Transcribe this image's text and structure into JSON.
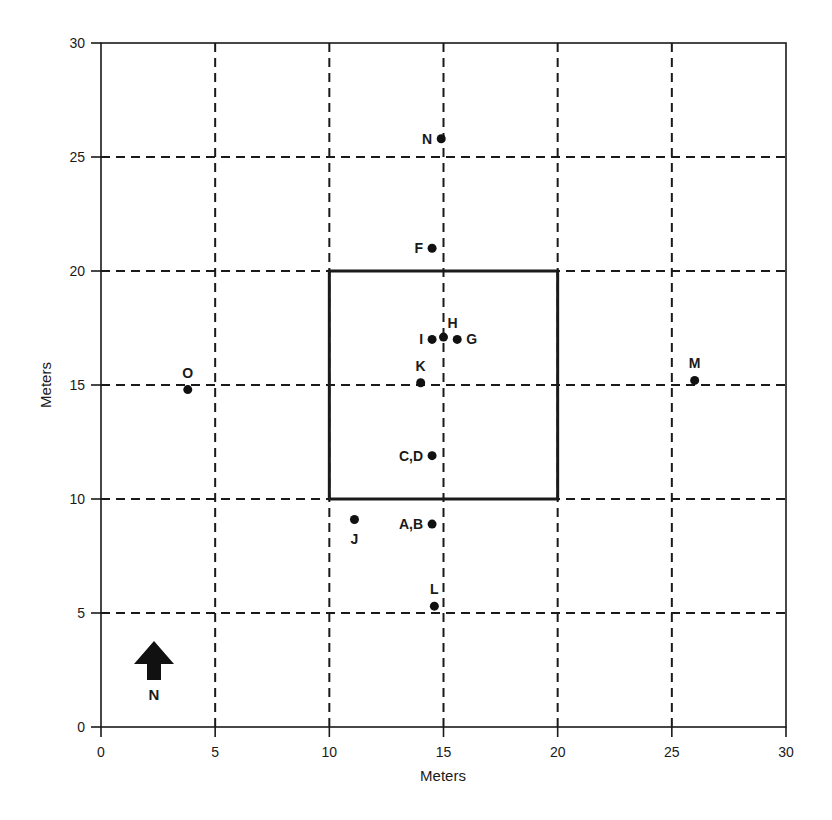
{
  "chart_data": {
    "type": "scatter",
    "title": "",
    "xlabel": "Meters",
    "ylabel": "Meters",
    "xlim": [
      0,
      30
    ],
    "ylim": [
      0,
      30
    ],
    "xticks": [
      0,
      5,
      10,
      15,
      20,
      25,
      30
    ],
    "yticks": [
      0,
      5,
      10,
      15,
      20,
      25,
      30
    ],
    "grid": {
      "on": true,
      "style": "dashed",
      "x": [
        5,
        10,
        15,
        20,
        25
      ],
      "y": [
        5,
        10,
        15,
        20,
        25
      ]
    },
    "legend": null,
    "annotations": [
      {
        "type": "rectangle",
        "x": [
          10,
          20
        ],
        "y": [
          10,
          20
        ],
        "style": "solid-thick"
      },
      {
        "type": "north-arrow",
        "label": "N",
        "x": 2.3,
        "y": 2.5
      }
    ],
    "points": [
      {
        "label": "N",
        "x": 14.9,
        "y": 25.8,
        "label_pos": "left"
      },
      {
        "label": "F",
        "x": 14.5,
        "y": 21.0,
        "label_pos": "left"
      },
      {
        "label": "H",
        "x": 15.0,
        "y": 17.1,
        "label_pos": "above-right"
      },
      {
        "label": "I",
        "x": 14.5,
        "y": 17.0,
        "label_pos": "left"
      },
      {
        "label": "G",
        "x": 15.6,
        "y": 17.0,
        "label_pos": "right"
      },
      {
        "label": "K",
        "x": 14.0,
        "y": 15.1,
        "label_pos": "above"
      },
      {
        "label": "C,D",
        "x": 14.5,
        "y": 11.9,
        "label_pos": "left"
      },
      {
        "label": "A,B",
        "x": 14.5,
        "y": 8.9,
        "label_pos": "left"
      },
      {
        "label": "J",
        "x": 11.1,
        "y": 9.1,
        "label_pos": "below"
      },
      {
        "label": "L",
        "x": 14.6,
        "y": 5.3,
        "label_pos": "above"
      },
      {
        "label": "O",
        "x": 3.8,
        "y": 14.8,
        "label_pos": "above"
      },
      {
        "label": "M",
        "x": 26.0,
        "y": 15.2,
        "label_pos": "above"
      }
    ]
  },
  "axes": {
    "x_title": "Meters",
    "y_title": "Meters",
    "x_tick_labels": [
      "0",
      "5",
      "10",
      "15",
      "20",
      "25",
      "30"
    ],
    "y_tick_labels": [
      "0",
      "5",
      "10",
      "15",
      "20",
      "25",
      "30"
    ]
  },
  "north_arrow": {
    "label": "N"
  },
  "colors": {
    "ink": "#1a1a1a",
    "background": "#ffffff"
  }
}
